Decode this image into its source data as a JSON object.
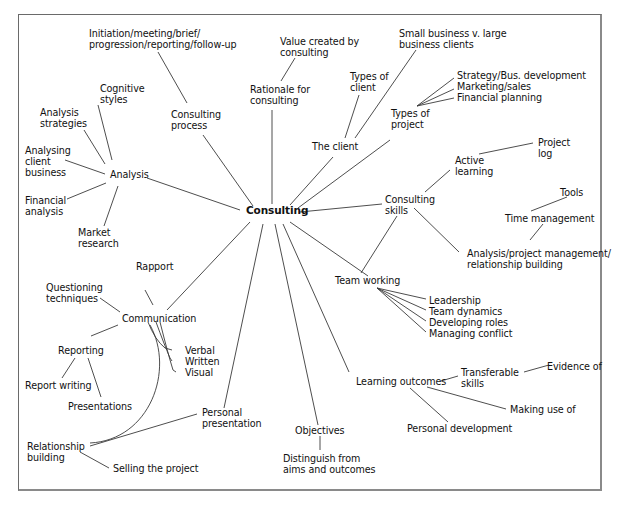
{
  "diagram": {
    "type": "mind-map",
    "center": "Consulting",
    "nodes": {
      "consulting": "Consulting",
      "consulting_process": "Consulting\nprocess",
      "initiation": "Initiation/meeting/brief/\nprogression/reporting/follow-up",
      "rationale": "Rationale for\nconsulting",
      "value_created": "Value created by\nconsulting",
      "the_client": "The client",
      "types_of_client": "Types of\nclient",
      "small_vs_large": "Small business v. large\nbusiness clients",
      "types_of_project": "Types of\nproject",
      "strategy": "Strategy/Bus. development",
      "marketing": "Marketing/sales",
      "financial_planning": "Financial planning",
      "consulting_skills": "Consulting\nskills",
      "active_learning": "Active\nlearning",
      "project_log": "Project\nlog",
      "tools": "Tools",
      "time_management": "Time management",
      "analysis_pm": "Analysis/project management/\nrelationship building",
      "team_working": "Team working",
      "leadership": "Leadership",
      "team_dynamics": "Team dynamics",
      "developing_roles": "Developing roles",
      "managing_conflict": "Managing conflict",
      "learning_outcomes": "Learning outcomes",
      "transferable_skills": "Transferable\nskills",
      "evidence_of": "Evidence of",
      "making_use_of": "Making use of",
      "personal_development": "Personal development",
      "objectives": "Objectives",
      "distinguish": "Distinguish from\naims and outcomes",
      "personal_presentation": "Personal\npresentation",
      "communication": "Communication",
      "rapport": "Rapport",
      "questioning": "Questioning\ntechniques",
      "verbal": "Verbal",
      "written": "Written",
      "visual": "Visual",
      "reporting": "Reporting",
      "report_writing": "Report writing",
      "presentations": "Presentations",
      "relationship_building": "Relationship\nbuilding",
      "selling_project": "Selling the project",
      "analysis": "Analysis",
      "cognitive_styles": "Cognitive\nstyles",
      "analysis_strategies": "Analysis\nstrategies",
      "analysing_client": "Analysing\nclient\nbusiness",
      "financial_analysis": "Financial\nanalysis",
      "market_research": "Market\nresearch"
    }
  }
}
